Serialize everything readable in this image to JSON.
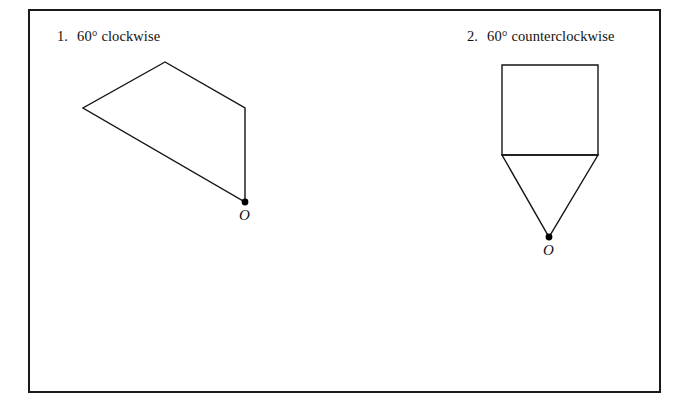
{
  "page": {
    "background_color": "#ffffff",
    "frame": {
      "border_color": "#1a1a1a",
      "x": 28,
      "y": 9,
      "width": 633,
      "height": 384
    }
  },
  "problems": [
    {
      "number": "1.",
      "instruction": "60° clockwise",
      "angle_degrees": 60,
      "direction": "clockwise",
      "center_label": "O",
      "shape": {
        "name": "quadrilateral",
        "stroke_color": "#141414",
        "vertices": [
          {
            "x": 165,
            "y": 62
          },
          {
            "x": 83,
            "y": 108
          },
          {
            "x": 245,
            "y": 202
          },
          {
            "x": 245,
            "y": 108
          }
        ]
      },
      "center_point": {
        "x": 245,
        "y": 202
      }
    },
    {
      "number": "2.",
      "instruction": "60° counterclockwise",
      "angle_degrees": 60,
      "direction": "counterclockwise",
      "center_label": "O",
      "shape": {
        "name": "square-with-triangle",
        "stroke_color": "#141414",
        "square": {
          "left": 502,
          "top": 65,
          "right": 598,
          "bottom": 155
        },
        "triangle": [
          {
            "x": 502,
            "y": 155
          },
          {
            "x": 598,
            "y": 155
          },
          {
            "x": 549,
            "y": 237
          }
        ]
      },
      "center_point": {
        "x": 549,
        "y": 237
      }
    }
  ]
}
